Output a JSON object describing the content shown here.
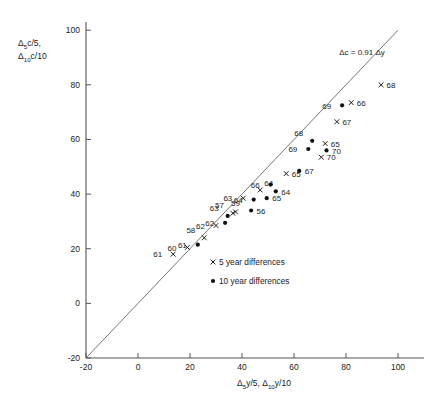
{
  "chart_data": {
    "type": "scatter",
    "title": "",
    "xlabel": "Δ₅y/5, Δ₁₀y/10",
    "ylabel": "Δ₅c/5, Δ₁₀c/10",
    "xlim": [
      -20,
      110
    ],
    "ylim": [
      -20,
      103
    ],
    "xticks": [
      -20,
      0,
      20,
      40,
      60,
      80,
      100
    ],
    "yticks": [
      -20,
      0,
      20,
      40,
      60,
      80,
      100
    ],
    "grid": false,
    "annotation": "Δc = 0.91 Δy",
    "reference_line": {
      "slope": 1,
      "intercept": 0,
      "from": [
        -20,
        -20
      ],
      "to": [
        100,
        100
      ]
    },
    "legend": {
      "position": "inside-lower-right",
      "entries": [
        {
          "marker": "cross",
          "label": "5 year differences"
        },
        {
          "marker": "dot",
          "label": "10 year differences"
        }
      ]
    },
    "series": [
      {
        "name": "5 year differences",
        "marker": "cross",
        "points": [
          {
            "label": "61",
            "x": 13.5,
            "y": 18.0,
            "label_pos": "left"
          },
          {
            "label": "60",
            "x": 19.0,
            "y": 20.5,
            "label_pos": "left"
          },
          {
            "label": "58",
            "x": 25.5,
            "y": 24.0,
            "label_pos": "upleft"
          },
          {
            "label": "62",
            "x": 30.0,
            "y": 28.5,
            "label_pos": "left"
          },
          {
            "label": "57",
            "x": 36.5,
            "y": 33.0,
            "label_pos": "upleft"
          },
          {
            "label": "59",
            "x": 37.5,
            "y": 33.5,
            "label_pos": "up"
          },
          {
            "label": "63",
            "x": 40.5,
            "y": 38.5,
            "label_pos": "left"
          },
          {
            "label": "64",
            "x": 47.0,
            "y": 41.5,
            "label_pos": "upright"
          },
          {
            "label": "65",
            "x": 57.0,
            "y": 47.5,
            "label_pos": "right"
          },
          {
            "label": "67",
            "x": 76.5,
            "y": 66.5,
            "label_pos": "right"
          },
          {
            "label": "66",
            "x": 82.0,
            "y": 73.5,
            "label_pos": "right"
          },
          {
            "label": "68",
            "x": 93.5,
            "y": 80.0,
            "label_pos": "right"
          },
          {
            "label": "65",
            "x": 72.0,
            "y": 58.5,
            "label_pos": "right"
          },
          {
            "label": "70",
            "x": 70.5,
            "y": 53.5,
            "label_pos": "right"
          }
        ]
      },
      {
        "name": "10 year differences",
        "marker": "dot",
        "points": [
          {
            "label": "61",
            "x": 23.0,
            "y": 21.5,
            "label_pos": "left"
          },
          {
            "label": "62",
            "x": 33.5,
            "y": 29.5,
            "label_pos": "left"
          },
          {
            "label": "63",
            "x": 34.5,
            "y": 32.0,
            "label_pos": "upleft"
          },
          {
            "label": "56",
            "x": 43.5,
            "y": 34.0,
            "label_pos": "right"
          },
          {
            "label": "64",
            "x": 44.5,
            "y": 38.0,
            "label_pos": "left"
          },
          {
            "label": "65",
            "x": 49.5,
            "y": 38.5,
            "label_pos": "right"
          },
          {
            "label": "66",
            "x": 51.0,
            "y": 43.5,
            "label_pos": "left"
          },
          {
            "label": "64",
            "x": 53.0,
            "y": 41.0,
            "label_pos": "right"
          },
          {
            "label": "67",
            "x": 62.0,
            "y": 48.5,
            "label_pos": "right"
          },
          {
            "label": "69",
            "x": 65.5,
            "y": 56.5,
            "label_pos": "left"
          },
          {
            "label": "68",
            "x": 67.0,
            "y": 59.5,
            "label_pos": "upleft"
          },
          {
            "label": "70",
            "x": 72.5,
            "y": 56.0,
            "label_pos": "right"
          },
          {
            "label": "69",
            "x": 78.5,
            "y": 72.5,
            "label_pos": "left"
          }
        ]
      }
    ]
  }
}
